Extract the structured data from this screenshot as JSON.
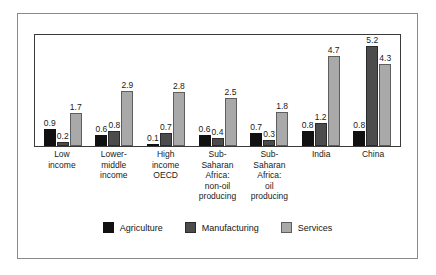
{
  "chart_data": {
    "type": "bar",
    "title": "",
    "subtitle": "",
    "xlabel": "",
    "ylabel": "",
    "ylim": [
      0,
      5.8
    ],
    "grid": false,
    "legend_position": "bottom",
    "value_labels": true,
    "categories": [
      "Low income",
      "Lower-middle income",
      "High income OECD",
      "Sub-Saharan Africa: non-oil producing",
      "Sub-Saharan Africa: oil producing",
      "India",
      "China"
    ],
    "category_lines": [
      [
        "Low",
        "income"
      ],
      [
        "Lower-",
        "middle",
        "income"
      ],
      [
        "High",
        "income",
        "OECD"
      ],
      [
        "Sub-",
        "Saharan",
        "Africa:",
        "non-oil",
        "producing"
      ],
      [
        "Sub-",
        "Saharan",
        "Africa:",
        "oil",
        "producing"
      ],
      [
        "India"
      ],
      [
        "China"
      ]
    ],
    "series": [
      {
        "name": "Agriculture",
        "color": "#111111",
        "values": [
          0.9,
          0.6,
          0.1,
          0.6,
          0.7,
          0.8,
          0.8
        ],
        "labels": [
          "0.9",
          "0.6",
          "0.1",
          "0.6",
          "0.7",
          "0.8",
          "0.8"
        ]
      },
      {
        "name": "Manufacturing",
        "color": "#4c4c4c",
        "values": [
          0.2,
          0.8,
          0.7,
          0.4,
          0.3,
          1.2,
          5.2
        ],
        "labels": [
          "0.2",
          "0.8",
          "0.7",
          "0.4",
          "0.3",
          "1.2",
          "5.2"
        ]
      },
      {
        "name": "Services",
        "color": "#a9a9a9",
        "values": [
          1.7,
          2.9,
          2.8,
          2.5,
          1.8,
          4.7,
          4.3
        ],
        "labels": [
          "1.7",
          "2.9",
          "2.8",
          "2.5",
          "1.8",
          "4.7",
          "4.3"
        ]
      }
    ]
  },
  "legend": {
    "items": [
      {
        "label": "Agriculture",
        "key": "agriculture"
      },
      {
        "label": "Manufacturing",
        "key": "manufacturing"
      },
      {
        "label": "Services",
        "key": "services"
      }
    ]
  }
}
